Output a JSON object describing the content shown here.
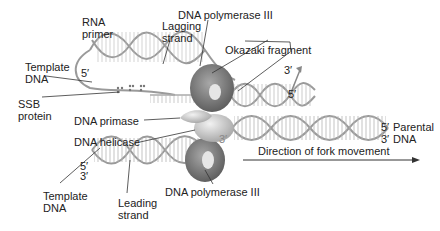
{
  "diagram": {
    "labels": {
      "rna_primer": [
        "RNA",
        "primer"
      ],
      "template_dna_top": [
        "Template",
        "DNA"
      ],
      "ssb_protein": [
        "SSB",
        "protein"
      ],
      "dna_polymerase_top": "DNA polymerase III",
      "lagging_strand": [
        "Lagging",
        "strand"
      ],
      "okazaki_fragment": "Okazaki fragment",
      "dna_primase": "DNA primase",
      "dna_helicase": "DNA helicase",
      "parental_dna": [
        "Parental",
        "DNA"
      ],
      "direction": "Direction of fork movement",
      "template_dna_bottom": [
        "Template",
        "DNA"
      ],
      "leading_strand": [
        "Leading",
        "strand"
      ],
      "dna_polymerase_bottom": "DNA polymerase III"
    },
    "ends": {
      "top_left_5": "5′",
      "okazaki_3": "3′",
      "okazaki_5": "5′",
      "parental_5": "5′",
      "parental_3": "3′",
      "bottom_5": "5′",
      "bottom_3": "3′",
      "center_3": "3′"
    },
    "colors": {
      "strand": "#9a9a9a",
      "rung": "#b8b8b8",
      "protein_dark": "#6f6f6f",
      "protein_light": "#cfcfcf",
      "leader": "#333333"
    }
  }
}
